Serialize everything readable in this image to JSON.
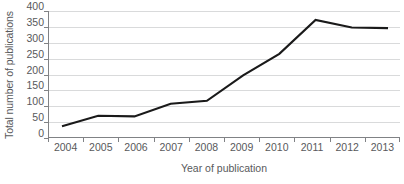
{
  "chart_data": {
    "type": "line",
    "title": "",
    "xlabel": "Year of publication",
    "ylabel": "Total number of publications",
    "categories": [
      "2004",
      "2005",
      "2006",
      "2007",
      "2008",
      "2009",
      "2010",
      "2011",
      "2012",
      "2013"
    ],
    "values": [
      37,
      70,
      68,
      108,
      117,
      197,
      265,
      372,
      348,
      346
    ],
    "series": [
      {
        "name": "Total number of publications",
        "values": [
          37,
          70,
          68,
          108,
          117,
          197,
          265,
          372,
          348,
          346
        ]
      }
    ],
    "ylim": [
      0,
      400
    ],
    "yticks": [
      0,
      50,
      100,
      150,
      200,
      250,
      300,
      350,
      400
    ],
    "ytick_labels": [
      "0",
      "50",
      "100",
      "150",
      "200",
      "250",
      "300",
      "350",
      "400"
    ],
    "grid": true,
    "grid_axis": "y",
    "legend": false,
    "legend_position": "none",
    "line_color": "#1a1a1a",
    "grid_color": "#d9dadb",
    "axis_color": "#808285",
    "text_color": "#58595b",
    "background_color": "#ffffff"
  }
}
